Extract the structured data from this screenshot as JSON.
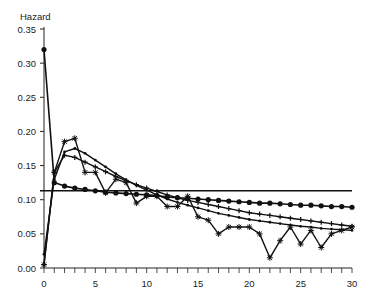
{
  "chart_data": {
    "type": "line",
    "title": "",
    "ylabel": "Hazard",
    "xlabel": "",
    "xlim": [
      0,
      30
    ],
    "ylim": [
      0,
      0.35
    ],
    "x_ticks": [
      0,
      5,
      10,
      15,
      20,
      25,
      30
    ],
    "x_tick_labels": [
      "0",
      "5",
      "10",
      "15",
      "20",
      "25",
      "30"
    ],
    "y_ticks": [
      0,
      0.05,
      0.1,
      0.15,
      0.2,
      0.25,
      0.3,
      0.35
    ],
    "y_tick_labels": [
      "0.00",
      "0.05",
      "0.10",
      "0.15",
      "0.20",
      "0.25",
      "0.30",
      "0.35"
    ],
    "grid": false,
    "legend": null,
    "x": [
      0,
      1,
      2,
      3,
      4,
      5,
      6,
      7,
      8,
      9,
      10,
      11,
      12,
      13,
      14,
      15,
      16,
      17,
      18,
      19,
      20,
      21,
      22,
      23,
      24,
      25,
      26,
      27,
      28,
      29,
      30
    ],
    "series": [
      {
        "name": "constant",
        "marker": "none",
        "values": [
          0.113,
          0.113,
          0.113,
          0.113,
          0.113,
          0.113,
          0.113,
          0.113,
          0.113,
          0.113,
          0.113,
          0.113,
          0.113,
          0.113,
          0.113,
          0.113,
          0.113,
          0.113,
          0.113,
          0.113,
          0.113,
          0.113,
          0.113,
          0.113,
          0.113,
          0.113,
          0.113,
          0.113,
          0.113,
          0.113,
          0.113
        ]
      },
      {
        "name": "decreasing (circles)",
        "marker": "circle",
        "values": [
          0.32,
          0.125,
          0.12,
          0.117,
          0.115,
          0.113,
          0.111,
          0.11,
          0.109,
          0.108,
          0.107,
          0.106,
          0.104,
          0.103,
          0.102,
          0.101,
          0.1,
          0.099,
          0.098,
          0.097,
          0.096,
          0.095,
          0.095,
          0.094,
          0.093,
          0.092,
          0.092,
          0.091,
          0.09,
          0.09,
          0.089
        ]
      },
      {
        "name": "peak early (plus)",
        "marker": "plus",
        "values": [
          0.005,
          0.14,
          0.165,
          0.162,
          0.155,
          0.148,
          0.141,
          0.134,
          0.128,
          0.122,
          0.117,
          0.112,
          0.107,
          0.103,
          0.099,
          0.096,
          0.093,
          0.09,
          0.087,
          0.084,
          0.081,
          0.079,
          0.077,
          0.075,
          0.073,
          0.071,
          0.069,
          0.067,
          0.065,
          0.063,
          0.061
        ]
      },
      {
        "name": "peak later (small plus)",
        "marker": "dot",
        "values": [
          0.02,
          0.13,
          0.17,
          0.175,
          0.168,
          0.158,
          0.148,
          0.138,
          0.129,
          0.121,
          0.114,
          0.107,
          0.101,
          0.096,
          0.092,
          0.088,
          0.084,
          0.08,
          0.077,
          0.074,
          0.071,
          0.069,
          0.067,
          0.065,
          0.063,
          0.061,
          0.06,
          0.058,
          0.057,
          0.056,
          0.055
        ]
      },
      {
        "name": "observed (stars)",
        "marker": "star",
        "values": [
          0.005,
          0.14,
          0.185,
          0.19,
          0.14,
          0.14,
          0.11,
          0.13,
          0.125,
          0.095,
          0.105,
          0.105,
          0.09,
          0.09,
          0.105,
          0.075,
          0.07,
          0.05,
          0.06,
          0.06,
          0.06,
          0.05,
          0.015,
          0.04,
          0.06,
          0.035,
          0.055,
          0.03,
          0.05,
          0.055,
          0.06
        ]
      }
    ]
  }
}
